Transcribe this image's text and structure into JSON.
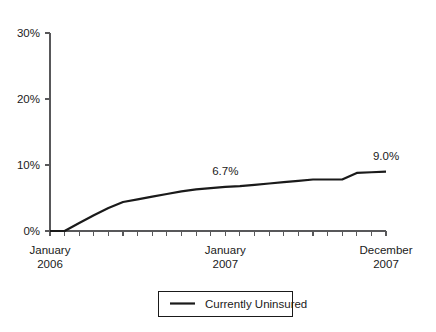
{
  "chart_data": {
    "type": "line",
    "title": "",
    "subtitle": "",
    "xlabel": "",
    "ylabel": "",
    "ylim": [
      0,
      30
    ],
    "grid": false,
    "legend_position": "bottom",
    "y_ticks": [
      "0%",
      "10%",
      "20%",
      "30%"
    ],
    "y_tick_values": [
      0,
      10,
      20,
      30
    ],
    "x_category_labels": [
      {
        "line1": "January",
        "line2": "2006",
        "index": 0
      },
      {
        "line1": "January",
        "line2": "2007",
        "index": 12
      },
      {
        "line1": "December",
        "line2": "2007",
        "index": 23
      }
    ],
    "x_tick_count": 24,
    "series": [
      {
        "name": "Currently Uninsured",
        "color": "#1a1a1a",
        "x": [
          0,
          1,
          2,
          3,
          4,
          5,
          6,
          7,
          8,
          9,
          10,
          11,
          12,
          13,
          14,
          15,
          16,
          17,
          18,
          19,
          20,
          21,
          22,
          23
        ],
        "values": [
          0.0,
          0.0,
          1.2,
          2.4,
          3.5,
          4.4,
          4.8,
          5.2,
          5.6,
          6.0,
          6.3,
          6.5,
          6.7,
          6.8,
          7.0,
          7.2,
          7.4,
          7.6,
          7.8,
          7.8,
          7.8,
          8.8,
          8.9,
          9.0
        ]
      }
    ],
    "annotations": [
      {
        "text": "6.7%",
        "x_index": 12,
        "value": 6.7
      },
      {
        "text": "9.0%",
        "x_index": 23,
        "value": 9.0
      }
    ],
    "legend": [
      {
        "label": "Currently Uninsured",
        "color": "#1a1a1a"
      }
    ]
  },
  "colors": {
    "series": "#1a1a1a",
    "axis": "#58585a",
    "background": "#ffffff",
    "text": "#1a1a1a"
  }
}
